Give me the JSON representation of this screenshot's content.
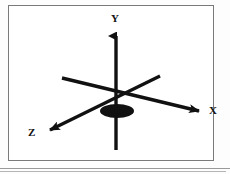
{
  "figure": {
    "title": "",
    "type": "3d-cartesian-axes-diagram",
    "background_color": "#ffffff",
    "frame": {
      "border_color": "#7a7a7a",
      "x": 8,
      "y": 5,
      "width": 206,
      "height": 156
    },
    "stroke_color": "#111111",
    "origin": {
      "x": 116,
      "y": 95
    },
    "labels": {
      "y_axis": "Y",
      "x_axis": "X",
      "z_axis": "Z"
    },
    "axes": [
      {
        "name": "y-axis",
        "label": "Y",
        "direction": "up",
        "arrow": true,
        "from": {
          "x": 116,
          "y": 150
        },
        "to": {
          "x": 116,
          "y": 28
        }
      },
      {
        "name": "x-axis",
        "label": "X",
        "direction": "down-right",
        "arrow": true,
        "from": {
          "x": 62,
          "y": 78
        },
        "to": {
          "x": 204,
          "y": 112
        }
      },
      {
        "name": "z-axis",
        "label": "Z",
        "direction": "down-left",
        "arrow": true,
        "from": {
          "x": 160,
          "y": 76
        },
        "to": {
          "x": 46,
          "y": 132
        }
      }
    ],
    "origin_disc": {
      "name": "origin-ellipse",
      "center": {
        "x": 117,
        "y": 111
      },
      "radius_x": 17,
      "radius_y": 7,
      "fill": "#111111"
    },
    "bottom_rules": [
      {
        "color": "#9a9a9a",
        "y": 168
      },
      {
        "color": "#b5b5b5",
        "y": 171
      }
    ]
  }
}
